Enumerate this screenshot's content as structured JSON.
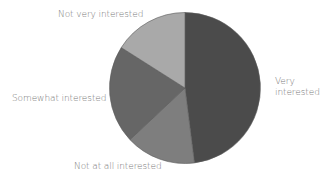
{
  "chart_data": {
    "type": "pie",
    "title": "",
    "start_angle_deg": 0,
    "direction": "clockwise",
    "slices": [
      {
        "label": "Very interested",
        "value": 48,
        "color": "#4b4b4b"
      },
      {
        "label": "Not at all interested",
        "value": 15,
        "color": "#7e7e7e"
      },
      {
        "label": "Somewhat interested",
        "value": 21,
        "color": "#666666"
      },
      {
        "label": "Not very interested",
        "value": 16,
        "color": "#a9a9a9"
      }
    ],
    "categories": [
      "Very interested",
      "Not at all interested",
      "Somewhat interested",
      "Not very interested"
    ],
    "values": [
      48,
      15,
      21,
      16
    ],
    "legend": "none (labels placed beside slices)"
  },
  "labels": {
    "very": "Very interested",
    "not_at_all": "Not at all interested",
    "somewhat": "Somewhat interested",
    "not_very": "Not very interested"
  },
  "style": {
    "label_color": "#7a7a7a",
    "separator_color": "#5a5a5a"
  }
}
